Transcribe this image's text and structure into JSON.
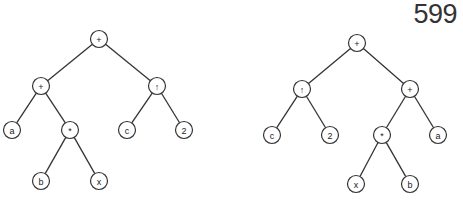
{
  "page_number": "599",
  "node_radius": 8.5,
  "trees": [
    {
      "name": "left-expression-tree",
      "nodes": [
        {
          "id": "L1",
          "label": "+",
          "x": 99,
          "y": 39
        },
        {
          "id": "L2",
          "label": "+",
          "x": 41,
          "y": 86
        },
        {
          "id": "L3",
          "label": "↑",
          "x": 157,
          "y": 86
        },
        {
          "id": "L4",
          "label": "a",
          "x": 12,
          "y": 130
        },
        {
          "id": "L5",
          "label": "*",
          "x": 70,
          "y": 130
        },
        {
          "id": "L6",
          "label": "c",
          "x": 127,
          "y": 130
        },
        {
          "id": "L7",
          "label": "2",
          "x": 184,
          "y": 130
        },
        {
          "id": "L8",
          "label": "b",
          "x": 41,
          "y": 181
        },
        {
          "id": "L9",
          "label": "x",
          "x": 99,
          "y": 181
        }
      ],
      "edges": [
        [
          "L1",
          "L2"
        ],
        [
          "L1",
          "L3"
        ],
        [
          "L2",
          "L4"
        ],
        [
          "L2",
          "L5"
        ],
        [
          "L3",
          "L6"
        ],
        [
          "L3",
          "L7"
        ],
        [
          "L5",
          "L8"
        ],
        [
          "L5",
          "L9"
        ]
      ]
    },
    {
      "name": "right-expression-tree",
      "nodes": [
        {
          "id": "R1",
          "label": "+",
          "x": 357,
          "y": 43
        },
        {
          "id": "R2",
          "label": "↑",
          "x": 302,
          "y": 89
        },
        {
          "id": "R3",
          "label": "+",
          "x": 410,
          "y": 89
        },
        {
          "id": "R4",
          "label": "c",
          "x": 272,
          "y": 135
        },
        {
          "id": "R5",
          "label": "2",
          "x": 330,
          "y": 135
        },
        {
          "id": "R6",
          "label": "*",
          "x": 382,
          "y": 135
        },
        {
          "id": "R7",
          "label": "a",
          "x": 438,
          "y": 135
        },
        {
          "id": "R8",
          "label": "x",
          "x": 356,
          "y": 184
        },
        {
          "id": "R9",
          "label": "b",
          "x": 410,
          "y": 184
        }
      ],
      "edges": [
        [
          "R1",
          "R2"
        ],
        [
          "R1",
          "R3"
        ],
        [
          "R2",
          "R4"
        ],
        [
          "R2",
          "R5"
        ],
        [
          "R3",
          "R6"
        ],
        [
          "R3",
          "R7"
        ],
        [
          "R6",
          "R8"
        ],
        [
          "R6",
          "R9"
        ]
      ]
    }
  ]
}
